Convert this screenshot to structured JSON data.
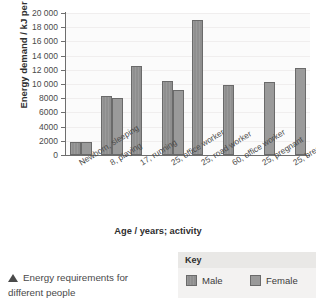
{
  "chart_data": {
    "type": "bar",
    "title": "",
    "xlabel": "Age / years; activity",
    "ylabel": "Energy demand / kJ per day",
    "ylim": [
      0,
      20000
    ],
    "ytick_labels": [
      "0",
      "2000",
      "4000",
      "6000",
      "8000",
      "10 000",
      "12 000",
      "14 000",
      "16 000",
      "18 000",
      "20 000"
    ],
    "ytick_values": [
      0,
      2000,
      4000,
      6000,
      8000,
      10000,
      12000,
      14000,
      16000,
      18000,
      20000
    ],
    "grid": true,
    "legend_position": "below-right",
    "categories": [
      "Newborn, sleeping",
      "8, playing",
      "17, running",
      "25, office worker",
      "25, road worker",
      "60, office worker",
      "25, pregnant",
      "25, breastfeeding"
    ],
    "series": [
      {
        "name": "Male",
        "color": "#8f8f8f",
        "values": [
          1800,
          8300,
          12500,
          10400,
          19000,
          9800,
          null,
          null
        ]
      },
      {
        "name": "Female",
        "color": "#9a9a9a",
        "values": [
          1800,
          8000,
          null,
          9200,
          null,
          null,
          10300,
          12300
        ]
      }
    ]
  },
  "axes": {
    "y_title": "Energy demand / kJ per day",
    "x_title": "Age / years; activity"
  },
  "legend": {
    "heading": "Key",
    "male_label": "Male",
    "female_label": "Female"
  },
  "caption": {
    "line1": "Energy requirements for",
    "line2": "different people"
  }
}
